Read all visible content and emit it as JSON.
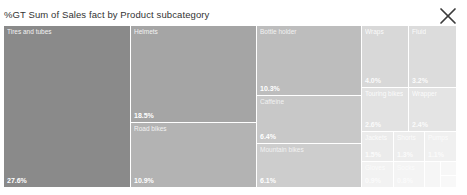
{
  "visual": {
    "title": "%GT Sum of Sales fact by Product subcategory",
    "close_label": "Close",
    "close_icon": "close-icon",
    "background": "#ffffff"
  },
  "chart_data": {
    "type": "treemap",
    "title": "%GT Sum of Sales fact by Product subcategory",
    "measure": "%GT Sum of Sales fact",
    "category_field": "Product subcategory",
    "value_suffix": "%",
    "legend": "none",
    "grid": false,
    "categories": [
      "Tires and tubes",
      "Helmets",
      "Road bikes",
      "Bottle holder",
      "Caffeine",
      "Mountain bikes",
      "Wraps",
      "Fluid",
      "Touring bikes",
      "Wrapper",
      "Jackets",
      "Shorts",
      "Pumps",
      "Gloves",
      "Socks",
      "Caps",
      "Vests",
      "Tools"
    ],
    "values": [
      27.6,
      18.5,
      10.9,
      10.3,
      6.4,
      6.1,
      4.0,
      3.2,
      2.6,
      2.4,
      1.5,
      1.3,
      1.1,
      0.9,
      0.8,
      0.6,
      0.5,
      0.4
    ],
    "value_labels": [
      "27.6%",
      "18.5%",
      "10.9%",
      "10.3%",
      "6.4%",
      "6.1%",
      "4.0%",
      "3.2%",
      "2.6%",
      "2.4%",
      "1.5%",
      "1.3%",
      "1.1%",
      "0.9%",
      "0.8%",
      "0.6%",
      "0.5%",
      "0.4%"
    ],
    "colors": [
      "#8a8a8a",
      "#a5a5a5",
      "#b3b3b3",
      "#bdbdbd",
      "#c8c8c8",
      "#cdcdcd",
      "#d8d8d8",
      "#dcdcdc",
      "#e2e2e2",
      "#e4e4e4",
      "#ebebeb",
      "#ededed",
      "#f0f0f0",
      "#f2f2f2",
      "#f4f4f4",
      "#f6f6f6",
      "#f7f7f7",
      "#f8f8f8"
    ],
    "tiles": [
      {
        "label": "Tires and tubes",
        "value_label": "27.6%",
        "color": "#8a8a8a",
        "x": 0,
        "y": 0,
        "w": 127,
        "h": 162,
        "label_class": "label-light",
        "value_class": "label-dark",
        "show_label": true,
        "show_value": true
      },
      {
        "label": "Helmets",
        "value_label": "18.5%",
        "color": "#a5a5a5",
        "x": 127,
        "y": 0,
        "w": 126,
        "h": 97,
        "label_class": "label-light",
        "value_class": "label-dark",
        "show_label": true,
        "show_value": true
      },
      {
        "label": "Road bikes",
        "value_label": "10.9%",
        "color": "#b3b3b3",
        "x": 127,
        "y": 97,
        "w": 126,
        "h": 65,
        "label_class": "label-light",
        "value_class": "label-dark",
        "show_label": true,
        "show_value": true
      },
      {
        "label": "Bottle holder",
        "value_label": "10.3%",
        "color": "#bdbdbd",
        "x": 253,
        "y": 0,
        "w": 105,
        "h": 70,
        "label_class": "label-light",
        "value_class": "label-dark",
        "show_label": true,
        "show_value": true
      },
      {
        "label": "Caffeine",
        "value_label": "6.4%",
        "color": "#c8c8c8",
        "x": 253,
        "y": 70,
        "w": 105,
        "h": 48,
        "label_class": "label-light",
        "value_class": "label-dark",
        "show_label": true,
        "show_value": true
      },
      {
        "label": "Mountain bikes",
        "value_label": "6.1%",
        "color": "#cdcdcd",
        "x": 253,
        "y": 118,
        "w": 105,
        "h": 44,
        "label_class": "label-light",
        "value_class": "label-dark",
        "show_label": true,
        "show_value": true
      },
      {
        "label": "Wraps",
        "value_label": "4.0%",
        "color": "#d8d8d8",
        "x": 358,
        "y": 0,
        "w": 47,
        "h": 62,
        "label_class": "label-faint",
        "value_class": "label-faint",
        "show_label": true,
        "show_value": true
      },
      {
        "label": "Fluid",
        "value_label": "3.2%",
        "color": "#dcdcdc",
        "x": 405,
        "y": 0,
        "w": 48,
        "h": 62,
        "label_class": "label-faint",
        "value_class": "label-faint",
        "show_label": true,
        "show_value": true
      },
      {
        "label": "Touring bikes",
        "value_label": "2.6%",
        "color": "#e2e2e2",
        "x": 358,
        "y": 62,
        "w": 47,
        "h": 44,
        "label_class": "label-faint",
        "value_class": "label-faint",
        "show_label": true,
        "show_value": true
      },
      {
        "label": "Wrapper",
        "value_label": "2.4%",
        "color": "#e4e4e4",
        "x": 405,
        "y": 62,
        "w": 48,
        "h": 44,
        "label_class": "label-faint",
        "value_class": "label-faint",
        "show_label": true,
        "show_value": true
      },
      {
        "label": "Jackets",
        "value_label": "1.5%",
        "color": "#ebebeb",
        "x": 358,
        "y": 106,
        "w": 32,
        "h": 30,
        "label_class": "label-faint",
        "value_class": "label-faint",
        "show_label": true,
        "show_value": true
      },
      {
        "label": "Shorts",
        "value_label": "1.3%",
        "color": "#ededed",
        "x": 390,
        "y": 106,
        "w": 31,
        "h": 30,
        "label_class": "label-faint",
        "value_class": "label-faint",
        "show_label": true,
        "show_value": true
      },
      {
        "label": "Pumps",
        "value_label": "1.1%",
        "color": "#f0f0f0",
        "x": 421,
        "y": 106,
        "w": 32,
        "h": 30,
        "label_class": "label-faint",
        "value_class": "label-faint",
        "show_label": true,
        "show_value": true
      },
      {
        "label": "Gloves",
        "value_label": "0.9%",
        "color": "#f2f2f2",
        "x": 358,
        "y": 136,
        "w": 32,
        "h": 26,
        "label_class": "label-faint",
        "value_class": "label-faint",
        "show_label": true,
        "show_value": true
      },
      {
        "label": "Socks",
        "value_label": "0.8%",
        "color": "#f4f4f4",
        "x": 390,
        "y": 136,
        "w": 31,
        "h": 26,
        "label_class": "label-faint",
        "value_class": "label-faint",
        "show_label": true,
        "show_value": true
      },
      {
        "label": "Caps",
        "value_label": "0.6%",
        "color": "#f6f6f6",
        "x": 421,
        "y": 136,
        "w": 16,
        "h": 26,
        "label_class": "label-faint",
        "value_class": "label-faint",
        "show_label": false,
        "show_value": false
      },
      {
        "label": "Vests",
        "value_label": "0.5%",
        "color": "#f7f7f7",
        "x": 437,
        "y": 136,
        "w": 16,
        "h": 14,
        "label_class": "label-faint",
        "value_class": "label-faint",
        "show_label": false,
        "show_value": false
      },
      {
        "label": "Tools",
        "value_label": "0.4%",
        "color": "#f8f8f8",
        "x": 437,
        "y": 150,
        "w": 16,
        "h": 12,
        "label_class": "label-faint",
        "value_class": "label-faint",
        "show_label": false,
        "show_value": false
      }
    ]
  }
}
